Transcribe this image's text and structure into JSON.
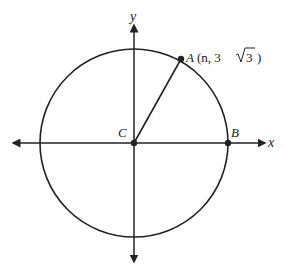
{
  "diagram": {
    "type": "circle-on-coordinate-plane",
    "axes": {
      "x_label": "x",
      "y_label": "y"
    },
    "circle": {
      "center_label": "C",
      "center_px": [
        134,
        143
      ],
      "radius_px": 94
    },
    "points": [
      {
        "name": "A",
        "label": "A",
        "coords_text_prefix": "(n, 3",
        "coords_radical": "3",
        "coords_text_suffix": ")"
      },
      {
        "name": "B",
        "label": "B"
      },
      {
        "name": "C",
        "label": "C"
      }
    ],
    "segments": [
      {
        "from": "C",
        "to": "A"
      }
    ],
    "colors": {
      "stroke": "#222222",
      "background": "#ffffff"
    }
  }
}
